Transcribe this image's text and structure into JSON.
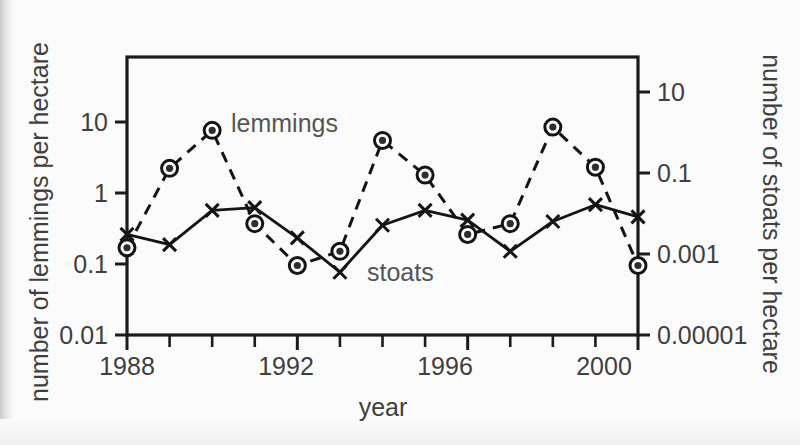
{
  "chart_data": {
    "type": "line",
    "title": "",
    "xlabel": "year",
    "ylabel": "number of lemmings per hectare",
    "y2label": "number of stoats per hectare",
    "x": [
      1988,
      1989,
      1990,
      1991,
      1992,
      1993,
      1994,
      1995,
      1996,
      1997,
      1998,
      1999,
      2000
    ],
    "xlim": [
      1988,
      2000
    ],
    "x_tick_labels": [
      "1988",
      "1992",
      "1996",
      "2000"
    ],
    "x_tick_label_values": [
      1988,
      1992,
      1996,
      2000
    ],
    "x_minor_ticks": [
      1989,
      1990,
      1991,
      1993,
      1994,
      1995,
      1997,
      1998,
      1999
    ],
    "yscale": "log",
    "ylim": [
      0.01,
      100
    ],
    "y_tick_labels": [
      "10",
      "1",
      "0.1",
      "0.01"
    ],
    "y_tick_values": [
      10,
      1,
      0.1,
      0.01
    ],
    "y2scale": "log",
    "y2lim": [
      1e-05,
      100
    ],
    "y2_tick_labels": [
      "10",
      "0.1",
      "0.001",
      "0.00001"
    ],
    "y2_tick_values": [
      10,
      0.1,
      0.001,
      1e-05
    ],
    "grid": false,
    "legend_position": "inline-annotations",
    "series": [
      {
        "name": "lemmings",
        "axis": "left",
        "units": "lemmings per hectare",
        "marker": "circle",
        "linestyle": "dashed",
        "values": [
          0.18,
          2.5,
          8.8,
          0.4,
          0.1,
          0.16,
          6.3,
          2.0,
          0.28,
          0.4,
          9.8,
          2.6,
          0.1
        ]
      },
      {
        "name": "stoats",
        "axis": "right",
        "units": "stoats per hectare",
        "marker": "x",
        "linestyle": "solid",
        "values_left_axis_equivalent": [
          0.28,
          0.2,
          0.62,
          0.68,
          0.25,
          0.08,
          0.38,
          0.62,
          0.45,
          0.16,
          0.43,
          0.75,
          0.5
        ],
        "values": [
          0.0062,
          0.0039,
          0.031,
          0.037,
          0.0054,
          0.00064,
          0.011,
          0.031,
          0.016,
          0.0021,
          0.015,
          0.045,
          0.02
        ]
      }
    ],
    "annotations": [
      {
        "text": "lemmings",
        "x": 1991.3,
        "y": 8.0
      },
      {
        "text": "stoats",
        "x": 1994.2,
        "y": 0.115
      }
    ]
  },
  "axis": {
    "x_title": "year",
    "left_title": "number of lemmings per hectare",
    "right_title": "number of stoats per hectare"
  },
  "labels": {
    "lemmings": "lemmings",
    "stoats": "stoats"
  },
  "colors": {
    "ink": "#141414",
    "text": "#3f3f3f",
    "background": "#fbfbfb"
  }
}
